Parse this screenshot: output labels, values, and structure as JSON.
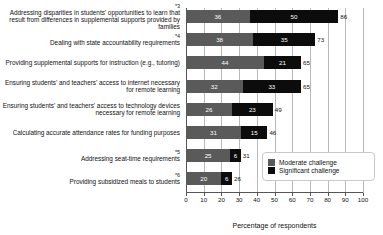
{
  "chart_data": {
    "type": "bar",
    "orientation": "horizontal",
    "stacked": true,
    "title": "",
    "xlabel": "Percentage of respondents",
    "ylabel": "",
    "xlim": [
      0,
      100
    ],
    "xticks": [
      0,
      10,
      20,
      30,
      40,
      50,
      60,
      70,
      80,
      90,
      100
    ],
    "grid": true,
    "legend_position": "bottom-right",
    "categories": [
      "Addressing disparities in students' opportunities to learn that result from differences in supplemental supports provided by families",
      "Dealing with state accountability requirements",
      "Providing supplemental supports for instruction (e.g., tutoring)",
      "Ensuring students' and teachers' access to internet necessary for remote learning",
      "Ensuring students' and teachers' access to technology devices necessary for remote learning",
      "Calculating accurate attendance rates for funding purposes",
      "Addressing seat-time requirements",
      "Providing subsidized meals to students"
    ],
    "category_markers": [
      "*3",
      "*4",
      "",
      "",
      "",
      "",
      "*5",
      "*6"
    ],
    "series": [
      {
        "name": "Moderate challenge",
        "color": "#5a5a5a",
        "values": [
          36,
          38,
          44,
          32,
          26,
          31,
          25,
          20
        ]
      },
      {
        "name": "Significant challenge",
        "color": "#0c0c0c",
        "values": [
          50,
          35,
          21,
          33,
          23,
          15,
          6,
          6
        ]
      }
    ],
    "totals": [
      86,
      73,
      65,
      65,
      49,
      46,
      31,
      26
    ]
  },
  "legend": {
    "items": [
      {
        "label": "Moderate challenge",
        "color": "#5a5a5a"
      },
      {
        "label": "Significant challenge",
        "color": "#0c0c0c"
      }
    ]
  }
}
